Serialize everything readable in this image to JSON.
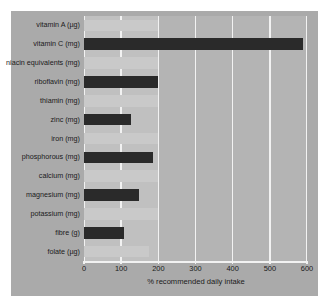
{
  "chart_data": {
    "type": "bar",
    "orientation": "horizontal",
    "title": "",
    "xlabel": "% recommended daily intake",
    "ylabel": "",
    "xlim": [
      0,
      600
    ],
    "xticks": [
      0,
      100,
      200,
      300,
      400,
      500,
      600
    ],
    "grid": true,
    "legend": "none",
    "categories": [
      "vitamin A (µg)",
      "vitamin C (mg)",
      "niacin equivalents (mg)",
      "riboflavin (mg)",
      "thiamin (mg)",
      "zinc (mg)",
      "iron (mg)",
      "phosphorous (mg)",
      "calcium (mg)",
      "magnesium (mg)",
      "potassium (mg)",
      "fibre (g)",
      "folate (µg)"
    ],
    "series": [
      {
        "name": "dark bars",
        "color": "#2a2a2a",
        "values": [
          0,
          590,
          0,
          200,
          0,
          127,
          0,
          185,
          0,
          147,
          0,
          108,
          0
        ]
      },
      {
        "name": "light bars",
        "color": "#c9c9c9",
        "values": [
          200,
          0,
          200,
          0,
          200,
          0,
          200,
          0,
          200,
          0,
          200,
          0,
          175
        ]
      }
    ],
    "values": [
      200,
      590,
      200,
      200,
      200,
      127,
      200,
      185,
      200,
      147,
      200,
      108,
      175
    ],
    "colors": {
      "figure_background": "#aaaaaa",
      "plot_background": "#b4b4b4",
      "shaded_band": "#c0c0c0",
      "gridline": "#f2f2f2",
      "bar_dark": "#2a2a2a",
      "bar_light": "#c9c9c9",
      "text": "#1a1a1a",
      "page_background": "#ffffff"
    }
  }
}
